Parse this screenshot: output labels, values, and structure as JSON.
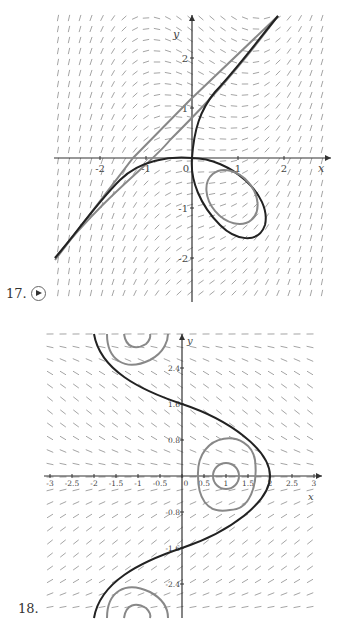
{
  "figures": [
    {
      "number": "17.",
      "has_play_button": true
    },
    {
      "number": "18.",
      "has_play_button": false
    }
  ],
  "chart_data": [
    {
      "type": "line",
      "title": "Direction field with solution curves (17)",
      "xlabel": "x",
      "ylabel": "y",
      "xticks": [
        "-2",
        "-1",
        "0",
        "1",
        "2"
      ],
      "yticks": [
        "2",
        "1",
        "-1",
        "-2"
      ],
      "xlim": [
        -2.9,
        3.0
      ],
      "ylim": [
        -2.8,
        2.6
      ],
      "grid": false,
      "background": "direction field (slope segments)",
      "series": [
        {
          "name": "black solution curve (upper branch)",
          "color": "#222222",
          "points": [
            [
              0,
              0
            ],
            [
              0.1,
              0.5
            ],
            [
              0.4,
              1.2
            ],
            [
              0.9,
              1.8
            ],
            [
              1.8,
              2.6
            ]
          ]
        },
        {
          "name": "black solution curve (left branch)",
          "color": "#222222",
          "points": [
            [
              0,
              0
            ],
            [
              -0.5,
              -0.05
            ],
            [
              -1.2,
              -0.3
            ],
            [
              -2,
              -1.1
            ],
            [
              -2.9,
              -2.2
            ]
          ]
        },
        {
          "name": "black loop",
          "color": "#222222",
          "shape": "closed loop from origin through (1.3,-1.6)"
        },
        {
          "name": "gray line",
          "color": "#888888",
          "points": [
            [
              -2.9,
              -2.2
            ],
            [
              -1.3,
              -0.3
            ],
            [
              0,
              1.2
            ],
            [
              1.8,
              2.6
            ]
          ]
        },
        {
          "name": "gray inner ellipse",
          "color": "#888888",
          "center": [
            1.0,
            -0.8
          ]
        }
      ]
    },
    {
      "type": "line",
      "title": "Direction field with solution curves (18)",
      "xlabel": "x",
      "ylabel": "y",
      "xticks": [
        "-3",
        "-2.5",
        "-2",
        "-1.5",
        "-1",
        "-0.5",
        "0",
        "0.5",
        "1",
        "1.5",
        "2",
        "2.5",
        "3"
      ],
      "yticks": [
        "2.4",
        "1.6",
        "0.8",
        "-0.8",
        "-1.6",
        "-2.4"
      ],
      "xlim": [
        -3,
        3
      ],
      "ylim": [
        -3.1,
        3.1
      ],
      "grid": false,
      "background": "direction field (slope segments)",
      "series": [
        {
          "name": "black S-curve",
          "color": "#222222",
          "points": [
            [
              -2,
              3.1
            ],
            [
              -1,
              2.2
            ],
            [
              0,
              1.6
            ],
            [
              1,
              1.0
            ],
            [
              2,
              0
            ],
            [
              1,
              -1.0
            ],
            [
              0,
              -1.6
            ],
            [
              -1,
              -2.2
            ],
            [
              -2,
              -3.1
            ]
          ]
        },
        {
          "name": "gray closed curves around (1,0)",
          "color": "#888888",
          "center": [
            1,
            0
          ]
        },
        {
          "name": "gray closed curves around (-1,3.1) and (-1,-3.1)",
          "color": "#888888"
        }
      ]
    }
  ]
}
